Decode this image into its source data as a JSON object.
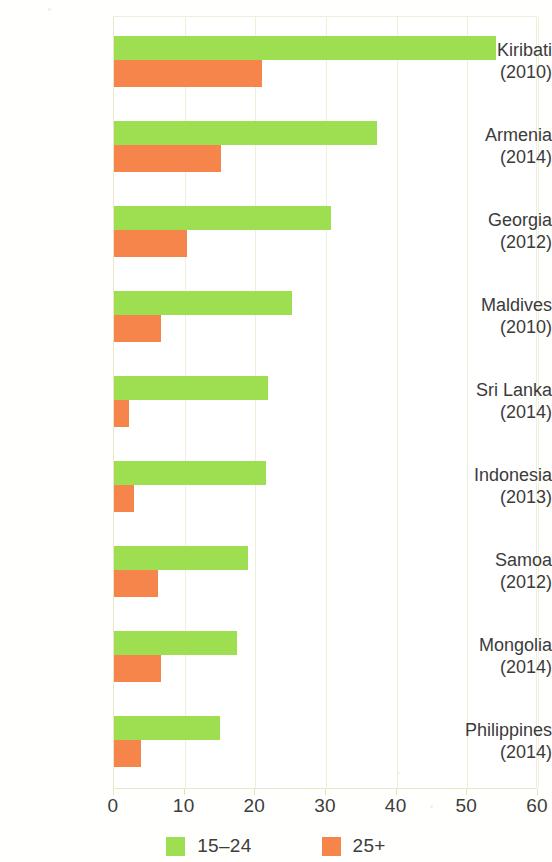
{
  "chart_data": {
    "type": "bar",
    "orientation": "horizontal",
    "title": "",
    "subtitle": "",
    "xlabel": "",
    "ylabel": "",
    "xlim": [
      0,
      60
    ],
    "xticks": [
      0,
      10,
      20,
      30,
      40,
      50,
      60
    ],
    "xtick_labels": [
      "0",
      "10",
      "20",
      "30",
      "40",
      "50",
      "60"
    ],
    "grid": true,
    "grid_axis": "x",
    "legend_position": "bottom",
    "categories": [
      "Kiribati (2010)",
      "Armenia (2014)",
      "Georgia (2012)",
      "Maldives (2010)",
      "Sri Lanka (2014)",
      "Indonesia (2013)",
      "Samoa (2012)",
      "Mongolia (2014)",
      "Philippines (2014)"
    ],
    "category_rows": [
      {
        "name": "Kiribati",
        "year": "(2010)"
      },
      {
        "name": "Armenia",
        "year": "(2014)"
      },
      {
        "name": "Georgia",
        "year": "(2012)"
      },
      {
        "name": "Maldives",
        "year": "(2010)"
      },
      {
        "name": "Sri Lanka",
        "year": "(2014)"
      },
      {
        "name": "Indonesia",
        "year": "(2013)"
      },
      {
        "name": "Samoa",
        "year": "(2012)"
      },
      {
        "name": "Mongolia",
        "year": "(2014)"
      },
      {
        "name": "Philippines",
        "year": "(2014)"
      }
    ],
    "series": [
      {
        "name": "15–24",
        "color": "#9ede51",
        "values": [
          54.0,
          37.2,
          30.7,
          25.2,
          21.8,
          21.5,
          19.0,
          17.4,
          15.0
        ]
      },
      {
        "name": "25+",
        "color": "#f5854b",
        "values": [
          21.0,
          15.2,
          10.3,
          6.6,
          2.1,
          2.9,
          6.2,
          6.7,
          3.8
        ]
      }
    ]
  },
  "legend": {
    "items": [
      {
        "label": "15–24",
        "color": "#9ede51"
      },
      {
        "label": "25+",
        "color": "#f5854b"
      }
    ]
  },
  "colors": {
    "series_young": "#9ede51",
    "series_older": "#f5854b",
    "gridline": "#f0efdc",
    "axis": "#e9e7c8",
    "text": "#3b3b3b",
    "background": "#ffffff"
  }
}
